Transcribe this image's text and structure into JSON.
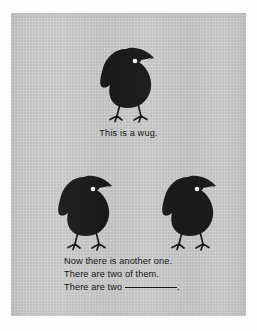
{
  "card": {
    "background_color": "#d0d0d0",
    "frame_color": "#fdfdfd",
    "ink_color": "#151515"
  },
  "illustration": {
    "creature_name": "wug",
    "creature_color": "#1a1a1a",
    "eye_color": "#f2f2f2",
    "figures": [
      {
        "id": "wug-top",
        "label": "wug-figure-top",
        "count_position": 1
      },
      {
        "id": "wug-left",
        "label": "wug-figure-bottom-left",
        "count_position": 2
      },
      {
        "id": "wug-right",
        "label": "wug-figure-bottom-right",
        "count_position": 3
      }
    ]
  },
  "caption": {
    "singular": "This is a wug."
  },
  "prompt": {
    "line1": "Now there is another one.",
    "line2": "There are two of them.",
    "line3_prefix": "There are two",
    "line3_suffix": "."
  }
}
